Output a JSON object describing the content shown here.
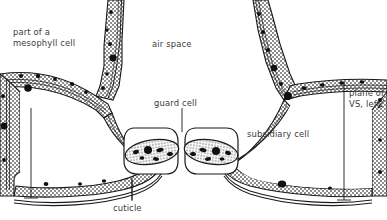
{
  "figure": {
    "width": 387,
    "height": 220,
    "background": "#ffffff",
    "ink_color": "#1a1a1a",
    "text_color": "#3a3a3a",
    "cytoplasm_fill": "#b4b4b4",
    "organelle_color": "#111111"
  },
  "labels": {
    "mesophyll": "part of a\nmesophyll cell",
    "air_space": "air space",
    "guard_cell": "guard cell",
    "subsidiary_cell": "subsidiary cell",
    "cuticle": "cuticle",
    "plane_of_vs": "plane of\nVS, left"
  },
  "structures": [
    {
      "name": "mesophyll-cell-left",
      "label": "part of a mesophyll cell"
    },
    {
      "name": "air-space",
      "label": "air space"
    },
    {
      "name": "guard-cell-left",
      "label": "guard cell"
    },
    {
      "name": "guard-cell-right",
      "label": "guard cell"
    },
    {
      "name": "subsidiary-cell-left",
      "label": "subsidiary cell"
    },
    {
      "name": "subsidiary-cell-right",
      "label": "subsidiary cell"
    },
    {
      "name": "cuticle-layer",
      "label": "cuticle"
    },
    {
      "name": "section-plane-line",
      "label": "plane of VS, left"
    }
  ]
}
